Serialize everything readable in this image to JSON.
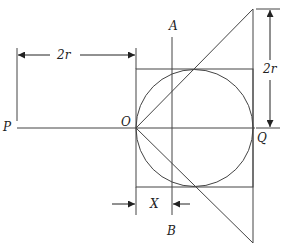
{
  "labels": {
    "P": "P",
    "O": "O",
    "Q": "Q",
    "A": "A",
    "B": "B",
    "X": "X",
    "dim_horizontal": "2r",
    "dim_vertical": "2r"
  },
  "colors": {
    "stroke": "#444444",
    "background": "#ffffff"
  }
}
